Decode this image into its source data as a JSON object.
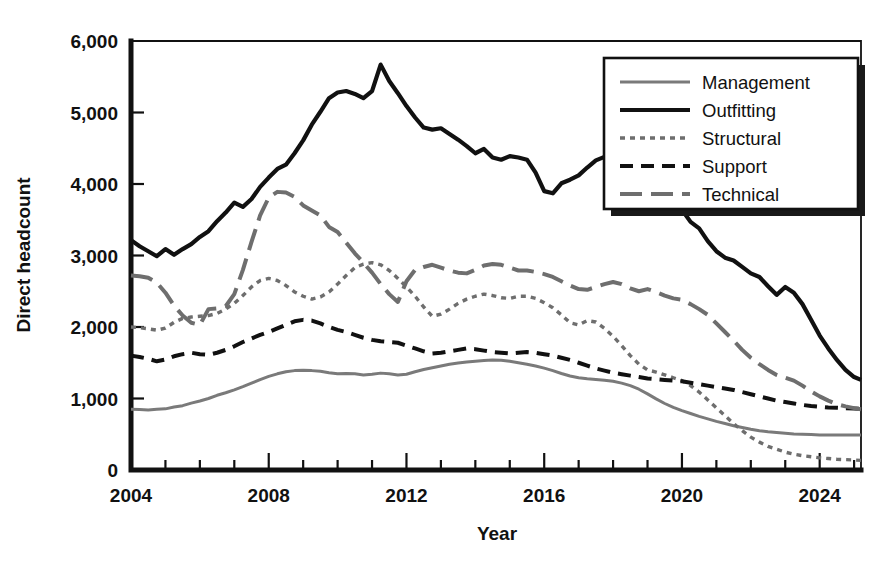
{
  "chart_data": {
    "type": "line",
    "title": "",
    "xlabel": "Year",
    "ylabel": "Direct headcount",
    "xlim": [
      2004,
      2025.2
    ],
    "ylim": [
      0,
      6000
    ],
    "grid": false,
    "legend_position": "top-right",
    "x_major_ticks": [
      2004,
      2008,
      2012,
      2016,
      2020,
      2024
    ],
    "x_major_tick_labels": [
      "2004",
      "2008",
      "2012",
      "2016",
      "2020",
      "2024"
    ],
    "x_minor_tick_step": 1,
    "y_ticks": [
      0,
      1000,
      2000,
      3000,
      4000,
      5000,
      6000
    ],
    "y_tick_labels": [
      "0",
      "1,000",
      "2,000",
      "3,000",
      "4,000",
      "5,000",
      "6,000"
    ],
    "x": [
      2004.0,
      2004.25,
      2004.5,
      2004.75,
      2005.0,
      2005.25,
      2005.5,
      2005.75,
      2006.0,
      2006.25,
      2006.5,
      2006.75,
      2007.0,
      2007.25,
      2007.5,
      2007.75,
      2008.0,
      2008.25,
      2008.5,
      2008.75,
      2009.0,
      2009.25,
      2009.5,
      2009.75,
      2010.0,
      2010.25,
      2010.5,
      2010.75,
      2011.0,
      2011.25,
      2011.5,
      2011.75,
      2012.0,
      2012.25,
      2012.5,
      2012.75,
      2013.0,
      2013.25,
      2013.5,
      2013.75,
      2014.0,
      2014.25,
      2014.5,
      2014.75,
      2015.0,
      2015.25,
      2015.5,
      2015.75,
      2016.0,
      2016.25,
      2016.5,
      2016.75,
      2017.0,
      2017.25,
      2017.5,
      2017.75,
      2018.0,
      2018.25,
      2018.5,
      2018.75,
      2019.0,
      2019.25,
      2019.5,
      2019.75,
      2020.0,
      2020.25,
      2020.5,
      2020.75,
      2021.0,
      2021.25,
      2021.5,
      2021.75,
      2022.0,
      2022.25,
      2022.5,
      2022.75,
      2023.0,
      2023.25,
      2023.5,
      2023.75,
      2024.0,
      2024.25,
      2024.5,
      2024.75,
      2025.0,
      2025.2
    ],
    "series": [
      {
        "name": "Management",
        "style": "solid",
        "color": "#7a7a7a",
        "width": 3.0,
        "values": [
          850,
          845,
          840,
          850,
          855,
          880,
          900,
          935,
          965,
          1000,
          1045,
          1080,
          1120,
          1165,
          1215,
          1265,
          1310,
          1345,
          1375,
          1390,
          1395,
          1390,
          1380,
          1360,
          1345,
          1350,
          1345,
          1330,
          1340,
          1355,
          1345,
          1330,
          1340,
          1375,
          1405,
          1430,
          1455,
          1480,
          1495,
          1510,
          1520,
          1530,
          1540,
          1535,
          1520,
          1500,
          1480,
          1455,
          1425,
          1390,
          1350,
          1315,
          1290,
          1275,
          1265,
          1255,
          1240,
          1215,
          1180,
          1130,
          1065,
          995,
          930,
          875,
          830,
          790,
          750,
          715,
          680,
          650,
          620,
          595,
          570,
          550,
          535,
          525,
          515,
          505,
          500,
          495,
          490,
          490,
          490,
          490,
          490,
          490
        ]
      },
      {
        "name": "Outfitting",
        "style": "solid",
        "color": "#111111",
        "width": 4.2,
        "values": [
          3215,
          3130,
          3060,
          2990,
          3090,
          3010,
          3090,
          3160,
          3260,
          3340,
          3480,
          3600,
          3740,
          3680,
          3790,
          3960,
          4090,
          4210,
          4270,
          4430,
          4610,
          4830,
          5010,
          5200,
          5280,
          5300,
          5260,
          5200,
          5300,
          5670,
          5440,
          5270,
          5090,
          4930,
          4790,
          4760,
          4780,
          4700,
          4620,
          4530,
          4430,
          4490,
          4370,
          4340,
          4390,
          4370,
          4340,
          4160,
          3900,
          3870,
          4010,
          4060,
          4120,
          4230,
          4330,
          4380,
          4430,
          4400,
          4370,
          4280,
          4120,
          3950,
          3830,
          3740,
          3640,
          3470,
          3380,
          3200,
          3060,
          2970,
          2930,
          2840,
          2750,
          2700,
          2570,
          2450,
          2560,
          2480,
          2320,
          2100,
          1880,
          1700,
          1540,
          1400,
          1300,
          1260
        ]
      },
      {
        "name": "Structural",
        "style": "dotted",
        "color": "#6e6e6e",
        "width": 3.4,
        "values": [
          2000,
          1990,
          1975,
          1955,
          1985,
          2065,
          2120,
          2140,
          2150,
          2160,
          2190,
          2250,
          2330,
          2440,
          2560,
          2650,
          2680,
          2650,
          2580,
          2490,
          2430,
          2390,
          2420,
          2490,
          2600,
          2720,
          2830,
          2880,
          2900,
          2870,
          2790,
          2680,
          2560,
          2430,
          2280,
          2150,
          2180,
          2250,
          2330,
          2390,
          2430,
          2460,
          2440,
          2410,
          2400,
          2430,
          2430,
          2400,
          2340,
          2270,
          2170,
          2060,
          2030,
          2090,
          2070,
          1980,
          1870,
          1740,
          1600,
          1480,
          1400,
          1370,
          1330,
          1290,
          1250,
          1180,
          1090,
          980,
          870,
          760,
          650,
          550,
          460,
          390,
          330,
          290,
          250,
          220,
          200,
          185,
          170,
          160,
          150,
          145,
          140,
          135
        ]
      },
      {
        "name": "Support",
        "style": "dashed",
        "color": "#111111",
        "width": 4.0,
        "values": [
          1600,
          1580,
          1555,
          1520,
          1545,
          1590,
          1620,
          1640,
          1620,
          1610,
          1640,
          1680,
          1730,
          1790,
          1840,
          1890,
          1930,
          1980,
          2030,
          2080,
          2100,
          2090,
          2050,
          2000,
          1960,
          1930,
          1890,
          1850,
          1820,
          1800,
          1790,
          1780,
          1740,
          1700,
          1660,
          1630,
          1640,
          1660,
          1680,
          1700,
          1690,
          1670,
          1650,
          1640,
          1630,
          1640,
          1650,
          1640,
          1620,
          1600,
          1570,
          1540,
          1500,
          1460,
          1420,
          1390,
          1360,
          1340,
          1320,
          1300,
          1280,
          1270,
          1260,
          1250,
          1240,
          1220,
          1200,
          1180,
          1160,
          1140,
          1120,
          1090,
          1060,
          1030,
          1000,
          970,
          950,
          930,
          910,
          895,
          885,
          875,
          870,
          865,
          860,
          855
        ]
      },
      {
        "name": "Technical",
        "style": "longdash",
        "color": "#6e6e6e",
        "width": 4.0,
        "values": [
          2720,
          2710,
          2690,
          2620,
          2480,
          2300,
          2160,
          2060,
          2030,
          2250,
          2260,
          2290,
          2460,
          2800,
          3190,
          3560,
          3810,
          3890,
          3880,
          3820,
          3700,
          3630,
          3560,
          3400,
          3330,
          3180,
          3030,
          2900,
          2760,
          2600,
          2460,
          2350,
          2640,
          2800,
          2840,
          2870,
          2830,
          2790,
          2760,
          2750,
          2800,
          2860,
          2880,
          2870,
          2830,
          2790,
          2790,
          2770,
          2740,
          2700,
          2640,
          2580,
          2530,
          2520,
          2560,
          2600,
          2630,
          2600,
          2540,
          2500,
          2530,
          2490,
          2440,
          2400,
          2380,
          2320,
          2250,
          2170,
          2050,
          1930,
          1810,
          1680,
          1570,
          1480,
          1400,
          1330,
          1290,
          1250,
          1180,
          1100,
          1030,
          970,
          920,
          890,
          865,
          850
        ]
      }
    ]
  },
  "axis": {
    "ylabel": "Direct headcount",
    "xlabel": "Year"
  },
  "legend": {
    "items": [
      {
        "label": "Management",
        "sample": "solid-gray-line-sample"
      },
      {
        "label": "Outfitting",
        "sample": "solid-black-line-sample"
      },
      {
        "label": "Structural",
        "sample": "dotted-gray-line-sample"
      },
      {
        "label": "Support",
        "sample": "dashed-black-line-sample"
      },
      {
        "label": "Technical",
        "sample": "longdash-gray-line-sample"
      }
    ]
  }
}
